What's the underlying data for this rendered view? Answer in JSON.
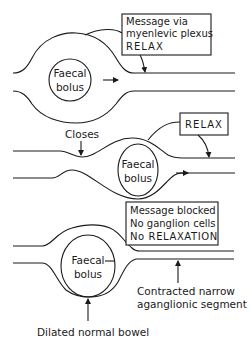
{
  "diagram": {
    "panel1": {
      "bolus_label": [
        "Faecal",
        "bolus"
      ],
      "message_box": [
        "Message via",
        "myenlevic plexus",
        "RELAX"
      ]
    },
    "panel2": {
      "closes_label": "Closes",
      "bolus_label": [
        "Faecal",
        "bolus"
      ],
      "message_box": [
        "RELAX"
      ]
    },
    "panel3": {
      "bolus_label": [
        "Faecal",
        "bolus"
      ],
      "message_box": [
        "Message blocked",
        "No ganglion cells",
        "No RELAXATION"
      ],
      "segment_label": [
        "Contracted narrow",
        "aganglionic segment"
      ],
      "bowel_label": "Dilated normal bowel"
    },
    "colors": {
      "line": "#1a1a1a",
      "background": "#ffffff"
    }
  }
}
